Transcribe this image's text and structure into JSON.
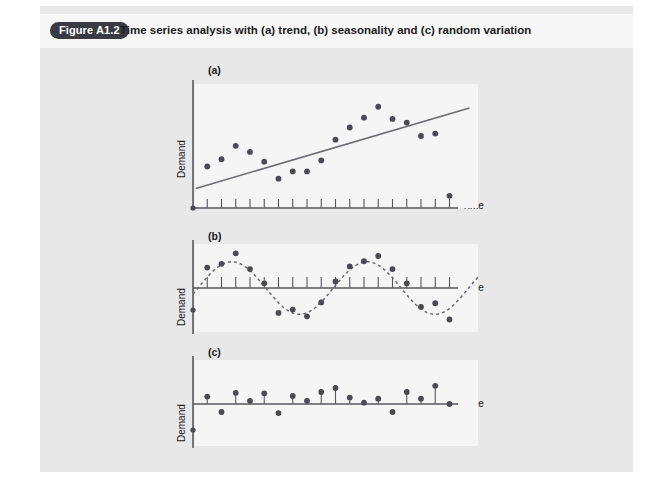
{
  "figure": {
    "badge_label": "Figure A1.2",
    "caption": "Time series analysis with (a) trend, (b) seasonality and (c) random variation",
    "badge_color": "#3a3a42",
    "panel_bg": "#e8e8e8",
    "plot_bg": "#f5f5f5",
    "axis_color": "#58585e",
    "marker_color": "#4a4a52",
    "line_color": "#6b6b72"
  },
  "chart_data": [
    {
      "id": "a",
      "type": "scatter",
      "panel_label": "(a)",
      "title": "trend",
      "xlabel": "Time",
      "ylabel": "Demand",
      "grid": false,
      "legend": "none",
      "xlim": [
        0,
        20
      ],
      "ylim": [
        0,
        10
      ],
      "tick_count": 18,
      "x": [
        1,
        2,
        3,
        4,
        5,
        6,
        7,
        8,
        9,
        10,
        11,
        12,
        13,
        14,
        15,
        16,
        17,
        18
      ],
      "y": [
        3.4,
        4.0,
        5.1,
        4.6,
        3.8,
        2.4,
        3.0,
        3.0,
        3.9,
        5.6,
        6.6,
        7.4,
        8.3,
        7.3,
        7.0,
        5.9,
        6.1,
        1.0
      ],
      "trendline": {
        "type": "line",
        "x": [
          0.2,
          19.4
        ],
        "y": [
          1.6,
          8.2
        ]
      }
    },
    {
      "id": "b",
      "type": "scatter",
      "panel_label": "(b)",
      "title": "seasonality",
      "xlabel": "Time",
      "ylabel": "Demand",
      "grid": false,
      "legend": "none",
      "xlim": [
        0,
        20
      ],
      "ylim": [
        -1.6,
        1.6
      ],
      "tick_count": 18,
      "x": [
        1,
        2,
        3,
        4,
        5,
        6,
        7,
        8,
        9,
        10,
        11,
        12,
        13,
        14,
        15,
        16,
        17,
        18
      ],
      "y": [
        0.78,
        0.92,
        1.32,
        0.72,
        0.18,
        -0.95,
        -0.82,
        -1.08,
        -0.55,
        0.25,
        0.82,
        1.02,
        1.22,
        0.72,
        0.18,
        -0.72,
        -0.58,
        -1.2
      ],
      "seasonal_curve": {
        "type": "sine",
        "amplitude": 1.0,
        "period": 9.5,
        "phase": 0.35,
        "style": "dashed"
      }
    },
    {
      "id": "c",
      "type": "scatter",
      "panel_label": "(c)",
      "title": "random variation",
      "xlabel": "Time",
      "ylabel": "Demand",
      "grid": false,
      "legend": "none",
      "xlim": [
        0,
        20
      ],
      "ylim": [
        -1.2,
        1.2
      ],
      "tick_count": 18,
      "x": [
        1,
        2,
        3,
        4,
        5,
        6,
        7,
        8,
        9,
        10,
        11,
        12,
        13,
        14,
        15,
        16,
        17,
        18
      ],
      "y": [
        0.28,
        -0.3,
        0.42,
        0.12,
        0.4,
        -0.34,
        0.3,
        0.12,
        0.45,
        0.6,
        0.24,
        0.05,
        0.2,
        -0.3,
        0.45,
        0.2,
        0.68,
        0.0
      ],
      "baseline": 0
    }
  ]
}
